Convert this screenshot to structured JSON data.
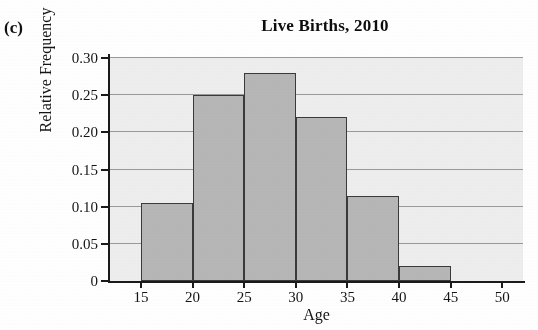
{
  "figure": {
    "panel_label": "(c)",
    "title": "Live Births, 2010"
  },
  "chart_data": {
    "type": "bar",
    "title": "Live Births, 2010",
    "xlabel": "Age",
    "ylabel": "Relative Frequency",
    "xlim": [
      12,
      52
    ],
    "ylim": [
      0,
      0.3
    ],
    "grid": true,
    "legend": "none",
    "bin_width": 5,
    "bin_edges": [
      15,
      20,
      25,
      30,
      35,
      40,
      45
    ],
    "categories": [
      "15-20",
      "20-25",
      "25-30",
      "30-35",
      "35-40",
      "40-45"
    ],
    "values": [
      0.105,
      0.25,
      0.28,
      0.22,
      0.115,
      0.02
    ],
    "bars": [
      {
        "label": "15-20",
        "start": 15,
        "end": 20,
        "value": 0.105
      },
      {
        "label": "20-25",
        "start": 20,
        "end": 25,
        "value": 0.25
      },
      {
        "label": "25-30",
        "start": 25,
        "end": 30,
        "value": 0.28
      },
      {
        "label": "30-35",
        "start": 30,
        "end": 35,
        "value": 0.22
      },
      {
        "label": "35-40",
        "start": 35,
        "end": 40,
        "value": 0.115
      },
      {
        "label": "40-45",
        "start": 40,
        "end": 45,
        "value": 0.02
      }
    ],
    "y_ticks": [
      {
        "value": 0,
        "label": "0"
      },
      {
        "value": 0.05,
        "label": "0.05"
      },
      {
        "value": 0.1,
        "label": "0.10"
      },
      {
        "value": 0.15,
        "label": "0.15"
      },
      {
        "value": 0.2,
        "label": "0.20"
      },
      {
        "value": 0.25,
        "label": "0.25"
      },
      {
        "value": 0.3,
        "label": "0.30"
      }
    ],
    "x_ticks": [
      {
        "value": 15,
        "label": "15"
      },
      {
        "value": 20,
        "label": "20"
      },
      {
        "value": 25,
        "label": "25"
      },
      {
        "value": 30,
        "label": "30"
      },
      {
        "value": 35,
        "label": "35"
      },
      {
        "value": 40,
        "label": "40"
      },
      {
        "value": 45,
        "label": "45"
      },
      {
        "value": 50,
        "label": "50"
      }
    ],
    "colors": {
      "bar_fill": "#b7b7b7",
      "bar_edge": "#3a3a3a",
      "plot_background": "#eeeeee",
      "gridline": "#9a9a9a",
      "axis": "#1a1a1a",
      "text": "#141414"
    }
  }
}
